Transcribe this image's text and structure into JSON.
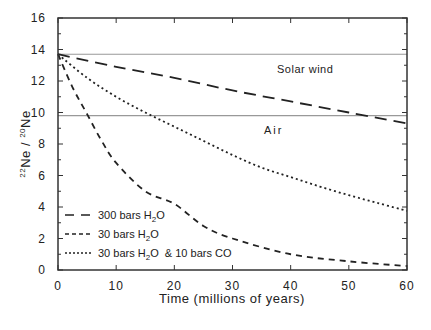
{
  "chart_data": {
    "type": "line",
    "title": "",
    "xlabel": "Time (millions of years)",
    "ylabel": "22Ne / 20Ne",
    "ylabel_parts": {
      "sup1": "22",
      "base1": "Ne / ",
      "sup2": "20",
      "base2": "Ne"
    },
    "xlim": [
      0,
      60
    ],
    "ylim": [
      0,
      16
    ],
    "x_ticks": [
      0,
      10,
      20,
      30,
      40,
      50,
      60
    ],
    "y_ticks": [
      0,
      2,
      4,
      6,
      8,
      10,
      12,
      14,
      16
    ],
    "grid": false,
    "legend_position": "lower left",
    "reference_lines": [
      {
        "label": "Solar wind",
        "y": 13.7,
        "color": "#999999"
      },
      {
        "label": "Air",
        "y": 9.8,
        "color": "#999999"
      }
    ],
    "series": [
      {
        "name": "300 bars H2O",
        "style": "long-dash",
        "x": [
          0,
          10,
          20,
          30,
          40,
          50,
          60
        ],
        "values": [
          13.7,
          12.9,
          12.2,
          11.4,
          10.7,
          10.0,
          9.3
        ]
      },
      {
        "name": "30 bars H2O",
        "style": "short-dash",
        "x": [
          0,
          2.5,
          5,
          7.5,
          10,
          15,
          20,
          25,
          30,
          40,
          50,
          60
        ],
        "values": [
          13.7,
          11.6,
          9.9,
          8.2,
          6.8,
          5.0,
          4.2,
          2.8,
          2.0,
          1.0,
          0.55,
          0.25
        ]
      },
      {
        "name": "30 bars H2O & 10 bars CO",
        "style": "dotted",
        "x": [
          0,
          5,
          10,
          15,
          20,
          25,
          30,
          35,
          40,
          45,
          50,
          55,
          60
        ],
        "values": [
          13.7,
          12.2,
          11.0,
          10.0,
          9.1,
          8.2,
          7.3,
          6.5,
          5.9,
          5.3,
          4.75,
          4.25,
          3.75
        ]
      }
    ]
  },
  "legend": [
    {
      "base": "300 bars H",
      "sub": "2",
      "tail": "O"
    },
    {
      "base": "30 bars H",
      "sub": "2",
      "tail": "O"
    },
    {
      "base": "30 bars H",
      "sub": "2",
      "tail": "O  & 10 bars CO"
    }
  ],
  "annotations": {
    "solar_wind": "Solar wind",
    "air": "Air"
  }
}
